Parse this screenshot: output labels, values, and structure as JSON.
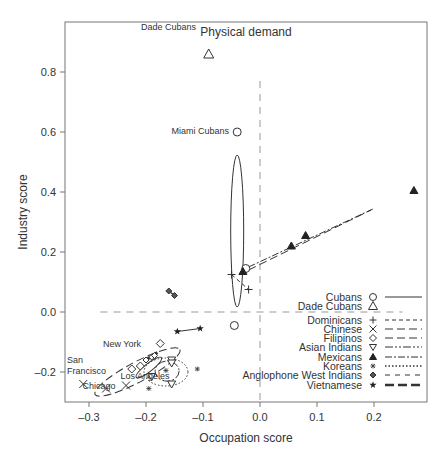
{
  "chart_data": {
    "type": "scatter",
    "title": "Physical demand",
    "xlabel": "Occupation score",
    "ylabel": "Industry score",
    "xlim": [
      -0.34,
      0.29
    ],
    "ylim": [
      -0.3,
      0.96
    ],
    "x_ticks": [
      "-0.3",
      "-0.2",
      "-0.1",
      "0.0",
      "0.1",
      "0.2"
    ],
    "y_ticks": [
      "-0.2",
      "0.0",
      "0.2",
      "0.4",
      "0.6",
      "0.8"
    ],
    "grid": false,
    "reference_lines": [
      {
        "type": "horizontal",
        "y": 0.0,
        "style": "dashed"
      },
      {
        "type": "vertical",
        "x": 0.0,
        "style": "dashed"
      }
    ],
    "annotations": [
      {
        "text": "Dade Cubans",
        "x": -0.09,
        "y": 0.86
      },
      {
        "text": "Miami Cubans",
        "x": -0.04,
        "y": 0.6
      },
      {
        "text": "New York",
        "x": -0.19,
        "y": -0.11
      },
      {
        "text": "San Francisco",
        "x": -0.3,
        "y": -0.19
      },
      {
        "text": "Chicago",
        "x": -0.26,
        "y": -0.26
      },
      {
        "text": "Los Angeles",
        "x": -0.18,
        "y": -0.26
      }
    ],
    "legend_position": "lower right",
    "series": [
      {
        "name": "Cubans",
        "marker": "circle",
        "line": "solid",
        "points": [
          [
            -0.04,
            0.6
          ],
          [
            -0.025,
            0.145
          ],
          [
            -0.045,
            -0.045
          ]
        ]
      },
      {
        "name": "Dade Cubans",
        "marker": "triangle-open",
        "line": "none",
        "points": [
          [
            -0.09,
            0.86
          ]
        ]
      },
      {
        "name": "Dominicans",
        "marker": "plus",
        "line": "short-dash",
        "points": [
          [
            -0.05,
            0.125
          ],
          [
            -0.02,
            0.075
          ]
        ]
      },
      {
        "name": "Chinese",
        "marker": "x",
        "line": "long-dash",
        "points": [
          [
            -0.31,
            -0.24
          ],
          [
            -0.27,
            -0.255
          ],
          [
            -0.235,
            -0.245
          ]
        ]
      },
      {
        "name": "Filipinos",
        "marker": "diamond",
        "line": "long-dash",
        "points": [
          [
            -0.175,
            -0.105
          ],
          [
            -0.225,
            -0.19
          ],
          [
            -0.21,
            -0.18
          ]
        ]
      },
      {
        "name": "Asian Indians",
        "marker": "triangle-down",
        "line": "dash-dot-dot",
        "points": [
          [
            -0.19,
            -0.215
          ],
          [
            -0.155,
            -0.16
          ],
          [
            -0.155,
            -0.24
          ]
        ]
      },
      {
        "name": "Mexicans",
        "marker": "triangle-filled",
        "line": "dash-dot",
        "points": [
          [
            -0.03,
            0.135
          ],
          [
            0.055,
            0.22
          ],
          [
            0.08,
            0.255
          ],
          [
            0.27,
            0.405
          ]
        ]
      },
      {
        "name": "Koreans",
        "marker": "asterisk",
        "line": "dotted",
        "points": [
          [
            -0.165,
            -0.195
          ],
          [
            -0.11,
            -0.19
          ],
          [
            -0.195,
            -0.255
          ]
        ]
      },
      {
        "name": "Anglophone West Indians",
        "marker": "cross-diamond",
        "line": "dashed",
        "points": [
          [
            -0.16,
            0.07
          ],
          [
            -0.15,
            0.055
          ]
        ]
      },
      {
        "name": "Vietnamese",
        "marker": "star",
        "line": "thick-dash",
        "points": [
          [
            -0.145,
            -0.065
          ],
          [
            -0.105,
            -0.055
          ]
        ]
      }
    ]
  }
}
